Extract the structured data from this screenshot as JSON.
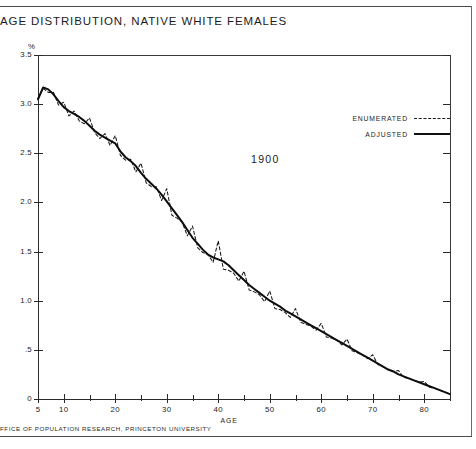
{
  "figure": {
    "title": "AGE DISTRIBUTION, NATIVE WHITE FEMALES",
    "footer": "FFICE OF POPULATION RESEARCH, PRINCETON UNIVERSITY",
    "year_annotation": "1900",
    "y_axis_unit": "%",
    "x_axis_name": "AGE"
  },
  "legend": {
    "position": "upper-right",
    "entries": [
      {
        "label": "ENUMERATED",
        "style": "dashed"
      },
      {
        "label": "ADJUSTED",
        "style": "solid"
      }
    ]
  },
  "axes": {
    "y_ticklabels": [
      "0",
      ".5",
      "1.0",
      "1.5",
      "2.0",
      "2.5",
      "3.0",
      "3.5"
    ],
    "y_tickvalues": [
      0,
      0.5,
      1.0,
      1.5,
      2.0,
      2.5,
      3.0,
      3.5
    ],
    "x_ticklabels": [
      "5",
      "10",
      "20",
      "30",
      "40",
      "50",
      "60",
      "70",
      "80"
    ],
    "x_tickvalues": [
      5,
      10,
      20,
      30,
      40,
      50,
      60,
      70,
      80
    ],
    "x_minor_tickvalues": [
      15,
      25,
      35,
      45,
      55,
      65,
      75,
      85
    ]
  },
  "chart_data": {
    "type": "line",
    "title": "AGE DISTRIBUTION, NATIVE WHITE FEMALES",
    "subtitle": "1900",
    "xlabel": "AGE",
    "ylabel": "%",
    "xlim": [
      5,
      85
    ],
    "ylim": [
      0,
      3.5
    ],
    "grid": false,
    "legend_position": "upper-right",
    "x": [
      5,
      6,
      7,
      8,
      9,
      10,
      11,
      12,
      13,
      14,
      15,
      16,
      17,
      18,
      19,
      20,
      21,
      22,
      23,
      24,
      25,
      26,
      27,
      28,
      29,
      30,
      31,
      32,
      33,
      34,
      35,
      36,
      37,
      38,
      39,
      40,
      41,
      42,
      43,
      44,
      45,
      46,
      47,
      48,
      49,
      50,
      51,
      52,
      53,
      54,
      55,
      56,
      57,
      58,
      59,
      60,
      61,
      62,
      63,
      64,
      65,
      66,
      67,
      68,
      69,
      70,
      71,
      72,
      73,
      74,
      75,
      76,
      77,
      78,
      79,
      80,
      81,
      82,
      83,
      84,
      85
    ],
    "series": [
      {
        "name": "ADJUSTED",
        "style": "solid",
        "values": [
          3.05,
          3.17,
          3.15,
          3.1,
          3.03,
          2.97,
          2.93,
          2.9,
          2.87,
          2.83,
          2.78,
          2.73,
          2.69,
          2.66,
          2.63,
          2.6,
          2.52,
          2.46,
          2.42,
          2.37,
          2.3,
          2.24,
          2.19,
          2.14,
          2.08,
          2.01,
          1.94,
          1.87,
          1.8,
          1.72,
          1.64,
          1.58,
          1.52,
          1.47,
          1.44,
          1.42,
          1.4,
          1.36,
          1.31,
          1.26,
          1.21,
          1.16,
          1.12,
          1.08,
          1.04,
          1.0,
          0.97,
          0.94,
          0.9,
          0.87,
          0.84,
          0.81,
          0.78,
          0.75,
          0.72,
          0.69,
          0.66,
          0.63,
          0.6,
          0.57,
          0.54,
          0.51,
          0.48,
          0.45,
          0.42,
          0.39,
          0.36,
          0.33,
          0.3,
          0.28,
          0.25,
          0.23,
          0.21,
          0.19,
          0.17,
          0.15,
          0.13,
          0.11,
          0.09,
          0.07,
          0.05
        ]
      },
      {
        "name": "ENUMERATED",
        "style": "dashed",
        "values": [
          3.06,
          3.16,
          3.12,
          3.12,
          2.99,
          3.02,
          2.88,
          2.93,
          2.83,
          2.8,
          2.86,
          2.71,
          2.65,
          2.7,
          2.58,
          2.68,
          2.48,
          2.43,
          2.44,
          2.31,
          2.4,
          2.2,
          2.16,
          2.16,
          2.02,
          2.14,
          1.87,
          1.84,
          1.8,
          1.66,
          1.76,
          1.54,
          1.49,
          1.47,
          1.39,
          1.61,
          1.32,
          1.31,
          1.28,
          1.2,
          1.3,
          1.11,
          1.09,
          1.06,
          0.99,
          1.1,
          0.92,
          0.91,
          0.88,
          0.83,
          0.92,
          0.78,
          0.76,
          0.74,
          0.7,
          0.77,
          0.63,
          0.62,
          0.6,
          0.55,
          0.61,
          0.49,
          0.47,
          0.45,
          0.41,
          0.45,
          0.35,
          0.33,
          0.3,
          0.28,
          0.29,
          0.22,
          0.21,
          0.19,
          0.17,
          0.18,
          0.12,
          0.11,
          0.09,
          0.07,
          0.05
        ]
      }
    ],
    "annotations": [
      {
        "text": "1900",
        "x": 40,
        "y": 3.1
      }
    ]
  }
}
